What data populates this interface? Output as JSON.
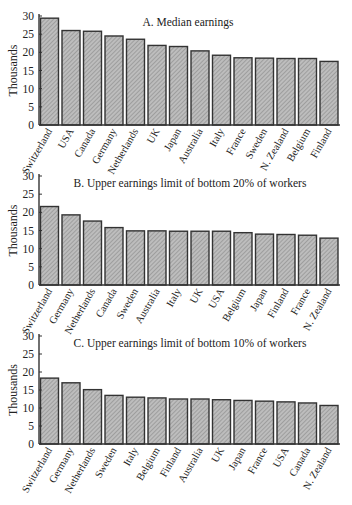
{
  "chart_data": [
    {
      "type": "bar",
      "title": "A. Median earnings",
      "xlabel": "",
      "ylabel": "Thousands",
      "ylim": [
        0,
        30
      ],
      "yticks": [
        0,
        5,
        10,
        15,
        20,
        25,
        30
      ],
      "grid": false,
      "legend": null,
      "categories": [
        "Switzerland",
        "USA",
        "Canada",
        "Germany",
        "Netherlands",
        "UK",
        "Japan",
        "Australia",
        "Italy",
        "France",
        "Sweden",
        "N. Zealand",
        "Belgium",
        "Finland"
      ],
      "values": [
        29.4,
        26.0,
        25.8,
        24.5,
        23.6,
        21.9,
        21.6,
        20.4,
        19.2,
        18.5,
        18.4,
        18.3,
        18.3,
        17.5
      ]
    },
    {
      "type": "bar",
      "title": "B. Upper earnings limit of bottom 20% of workers",
      "xlabel": "",
      "ylabel": "Thousands",
      "ylim": [
        0,
        30
      ],
      "yticks": [
        0,
        5,
        10,
        15,
        20,
        25,
        30
      ],
      "grid": false,
      "legend": null,
      "categories": [
        "Switzerland",
        "Germany",
        "Netherlands",
        "Canada",
        "Sweden",
        "Australia",
        "Italy",
        "UK",
        "USA",
        "Belgium",
        "Japan",
        "Finland",
        "France",
        "N. Zealand"
      ],
      "values": [
        21.6,
        19.3,
        17.6,
        15.8,
        14.9,
        14.9,
        14.8,
        14.8,
        14.8,
        14.4,
        14.0,
        13.9,
        13.7,
        12.9
      ]
    },
    {
      "type": "bar",
      "title": "C. Upper earnings limit of bottom 10% of workers",
      "xlabel": "",
      "ylabel": "Thousands",
      "ylim": [
        0,
        30
      ],
      "yticks": [
        0,
        5,
        10,
        15,
        20,
        25,
        30
      ],
      "grid": false,
      "legend": null,
      "categories": [
        "Switzerland",
        "Germany",
        "Netherlands",
        "Sweden",
        "Italy",
        "Belgium",
        "Finland",
        "Australia",
        "UK",
        "Japan",
        "France",
        "USA",
        "Canada",
        "N. Zealand"
      ],
      "values": [
        18.3,
        17.0,
        15.1,
        13.5,
        13.0,
        12.8,
        12.5,
        12.5,
        12.3,
        12.1,
        11.9,
        11.7,
        11.4,
        10.7
      ]
    }
  ],
  "style": {
    "bar_fill": "#bdbdbd",
    "bar_hatch": "#8a8a8a",
    "bar_stroke": "#333333",
    "axis_color": "#333333"
  }
}
